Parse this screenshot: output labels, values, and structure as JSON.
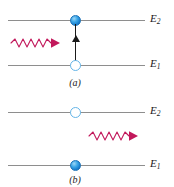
{
  "figure": {
    "type": "physics-energy-level-diagram",
    "colors": {
      "level_line": "#8e8e8e",
      "electron_filled": "#1477c8",
      "electron_open_outline": "#64b5e8",
      "photon": "#c2185b",
      "transition_arrow": "#1a1a1a",
      "label_text": "#1a1a1a",
      "background": "#ffffff"
    },
    "panels": [
      {
        "id": "a",
        "caption": "(a)",
        "levels": [
          {
            "id": "E2",
            "label": "E",
            "subscript": "2",
            "electron": "filled"
          },
          {
            "id": "E1",
            "label": "E",
            "subscript": "1",
            "electron": "open"
          }
        ],
        "transition_arrow": {
          "direction": "up",
          "from": "E1",
          "to": "E2"
        },
        "photon": {
          "direction": "right",
          "position": "incoming-left",
          "waves": 5
        }
      },
      {
        "id": "b",
        "caption": "(b)",
        "levels": [
          {
            "id": "E2",
            "label": "E",
            "subscript": "2",
            "electron": "open"
          },
          {
            "id": "E1",
            "label": "E",
            "subscript": "1",
            "electron": "filled"
          }
        ],
        "transition_arrow": null,
        "photon": {
          "direction": "right",
          "position": "outgoing-right",
          "waves": 5
        }
      }
    ]
  }
}
